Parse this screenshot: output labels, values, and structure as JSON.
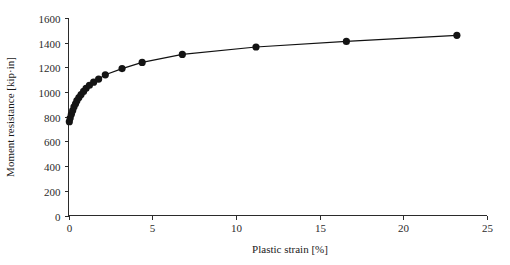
{
  "chart_data": {
    "type": "line",
    "title": "",
    "subtitle": "",
    "xlabel": "Plastic strain [%]",
    "ylabel": "Moment resistance [kip·in]",
    "xlim": [
      0,
      25
    ],
    "ylim": [
      0,
      1600
    ],
    "xticks": [
      0,
      5,
      10,
      15,
      20,
      25
    ],
    "yticks": [
      0,
      200,
      400,
      600,
      800,
      1000,
      1200,
      1400,
      1600
    ],
    "xtick_labels": [
      "0",
      "5",
      "10",
      "15",
      "20",
      "25"
    ],
    "ytick_labels": [
      "0",
      "200",
      "400",
      "600",
      "800",
      "1000",
      "1200",
      "1400",
      "1600"
    ],
    "grid": false,
    "legend": null,
    "legend_position": "none",
    "marker": "filled-circle",
    "marker_color": "#141414",
    "line_color": "#111111",
    "series": [
      {
        "name": "Moment resistance",
        "x": [
          0.05,
          0.1,
          0.17,
          0.25,
          0.33,
          0.42,
          0.5,
          0.62,
          0.75,
          0.9,
          1.05,
          1.25,
          1.5,
          1.8,
          2.2,
          3.2,
          4.4,
          6.8,
          11.2,
          16.6,
          23.2
        ],
        "y": [
          760,
          790,
          820,
          850,
          880,
          905,
          930,
          955,
          980,
          1005,
          1030,
          1055,
          1080,
          1105,
          1140,
          1190,
          1240,
          1305,
          1365,
          1410,
          1460
        ]
      }
    ],
    "annotations": []
  },
  "axis_titles": {
    "x": "Plastic strain [%]",
    "y": "Moment resistance [kip·in]"
  }
}
